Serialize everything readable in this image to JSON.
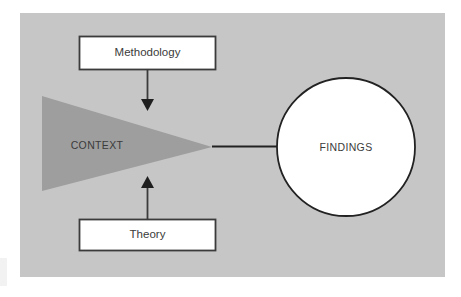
{
  "diagram": {
    "panel": {
      "background_color": "#c6c6c6",
      "page_background_color": "#ffffff"
    },
    "nodes": {
      "methodology": {
        "label": "Methodology",
        "shape": "rectangle",
        "fill_color": "#ffffff",
        "stroke_color": "#3b3b3b"
      },
      "theory": {
        "label": "Theory",
        "shape": "rectangle",
        "fill_color": "#ffffff",
        "stroke_color": "#3b3b3b"
      },
      "context": {
        "label": "CONTEXT",
        "shape": "triangle-right",
        "fill_color": "#9e9e9e"
      },
      "findings": {
        "label": "FINDINGS",
        "shape": "circle",
        "fill_color": "#ffffff",
        "stroke_color": "#222222"
      }
    },
    "connectors": [
      {
        "name": "methodology-to-context",
        "from": "methodology",
        "to": "context",
        "style": "arrow-down",
        "color": "#3b3b3b"
      },
      {
        "name": "theory-to-context",
        "from": "theory",
        "to": "context",
        "style": "arrow-up",
        "color": "#3b3b3b"
      },
      {
        "name": "context-to-findings",
        "from": "context",
        "to": "findings",
        "style": "line",
        "color": "#222222"
      }
    ]
  }
}
